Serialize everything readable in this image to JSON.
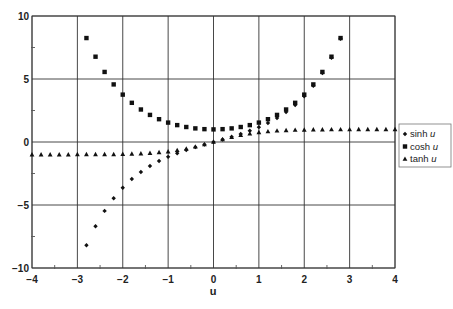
{
  "chart_data": {
    "type": "scatter",
    "title": "",
    "xlabel": "u",
    "ylabel": "",
    "xlim": [
      -4,
      4
    ],
    "ylim": [
      -10,
      10
    ],
    "xticks": [
      -4,
      -3,
      -2,
      -1,
      0,
      1,
      2,
      3,
      4
    ],
    "xtick_labels": [
      "−4",
      "−3",
      "−2",
      "−1",
      "0",
      "1",
      "2",
      "3",
      "4"
    ],
    "yticks": [
      10,
      5,
      0,
      -5,
      -10
    ],
    "ytick_labels": [
      "10",
      "5",
      "0",
      "−5",
      "−10"
    ],
    "grid": true,
    "legend_position": "right",
    "series": [
      {
        "name": "sinh u",
        "legend_prefix": "sinh ",
        "legend_var": "u",
        "marker": "diamond",
        "x": [
          -2.8,
          -2.6,
          -2.4,
          -2.2,
          -2.0,
          -1.8,
          -1.6,
          -1.4,
          -1.2,
          -1.0,
          -0.8,
          -0.6,
          -0.4,
          -0.2,
          0.0,
          0.2,
          0.4,
          0.6,
          0.8,
          1.0,
          1.2,
          1.4,
          1.6,
          1.8,
          2.0,
          2.2,
          2.4,
          2.6,
          2.8
        ],
        "values": [
          -8.19,
          -6.69,
          -5.47,
          -4.46,
          -3.63,
          -2.94,
          -2.38,
          -1.9,
          -1.51,
          -1.18,
          -0.89,
          -0.64,
          -0.41,
          -0.2,
          0.0,
          0.2,
          0.41,
          0.64,
          0.89,
          1.18,
          1.51,
          1.9,
          2.38,
          2.94,
          3.63,
          4.46,
          5.47,
          6.69,
          8.19
        ]
      },
      {
        "name": "cosh u",
        "legend_prefix": "cosh ",
        "legend_var": "u",
        "marker": "square",
        "x": [
          -2.8,
          -2.6,
          -2.4,
          -2.2,
          -2.0,
          -1.8,
          -1.6,
          -1.4,
          -1.2,
          -1.0,
          -0.8,
          -0.6,
          -0.4,
          -0.2,
          0.0,
          0.2,
          0.4,
          0.6,
          0.8,
          1.0,
          1.2,
          1.4,
          1.6,
          1.8,
          2.0,
          2.2,
          2.4,
          2.6,
          2.8
        ],
        "values": [
          8.25,
          6.77,
          5.56,
          4.57,
          3.76,
          3.11,
          2.58,
          2.15,
          1.81,
          1.54,
          1.34,
          1.19,
          1.08,
          1.02,
          1.0,
          1.02,
          1.08,
          1.19,
          1.34,
          1.54,
          1.81,
          2.15,
          2.58,
          3.11,
          3.76,
          4.57,
          5.56,
          6.77,
          8.25
        ]
      },
      {
        "name": "tanh u",
        "legend_prefix": "tanh ",
        "legend_var": "u",
        "marker": "triangle",
        "x": [
          -4.0,
          -3.8,
          -3.6,
          -3.4,
          -3.2,
          -3.0,
          -2.8,
          -2.6,
          -2.4,
          -2.2,
          -2.0,
          -1.8,
          -1.6,
          -1.4,
          -1.2,
          -1.0,
          -0.8,
          -0.6,
          -0.4,
          -0.2,
          0.0,
          0.2,
          0.4,
          0.6,
          0.8,
          1.0,
          1.2,
          1.4,
          1.6,
          1.8,
          2.0,
          2.2,
          2.4,
          2.6,
          2.8,
          3.0,
          3.2,
          3.4,
          3.6,
          3.8,
          4.0
        ],
        "values": [
          -1.0,
          -1.0,
          -1.0,
          -1.0,
          -1.0,
          -0.99,
          -0.99,
          -0.99,
          -0.98,
          -0.98,
          -0.96,
          -0.95,
          -0.92,
          -0.89,
          -0.83,
          -0.76,
          -0.66,
          -0.54,
          -0.38,
          -0.2,
          0.0,
          0.2,
          0.38,
          0.54,
          0.66,
          0.76,
          0.83,
          0.89,
          0.92,
          0.95,
          0.96,
          0.98,
          0.98,
          0.99,
          0.99,
          0.99,
          1.0,
          1.0,
          1.0,
          1.0,
          1.0
        ]
      }
    ]
  },
  "colors": {
    "background": "#ffffff",
    "grid": "#333333",
    "axis": "#555555",
    "marker": "#111111",
    "text": "#222222"
  }
}
